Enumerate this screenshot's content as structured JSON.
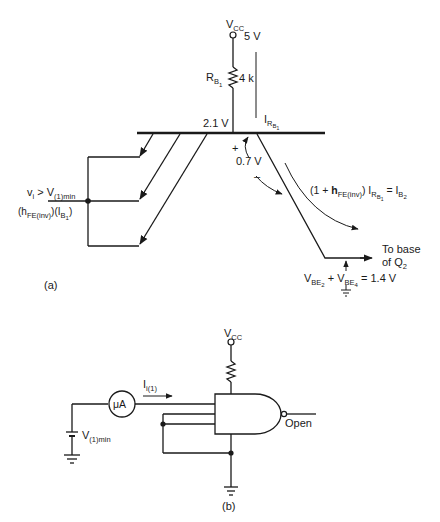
{
  "figure_a": {
    "caption": "(a)",
    "vcc_label": "V",
    "vcc_sub": "CC",
    "vcc_value": "5 V",
    "resistor_label": "R",
    "resistor_sub": "B",
    "resistor_subsub": "1",
    "resistor_value": "4 k",
    "base_voltage": "2.1 V",
    "current_label": "I",
    "current_sub": "R",
    "current_subsub": "B",
    "current_subsubsub": "1",
    "vbc_plus": "+",
    "vbc_value": "0.7 V",
    "vbc_minus": "–",
    "input_label_main": "v",
    "input_label_i": "i",
    "input_label_gt": " > V",
    "input_label_sub": "(1)min",
    "emitter_current_h": "(h",
    "emitter_current_hsub": "FE(inv)",
    "emitter_current_rest": ")(I",
    "emitter_current_isub": "B",
    "emitter_current_isubsub": "1",
    "emitter_current_close": ")",
    "collector_eq_1": "(1 + ",
    "collector_eq_h": "h",
    "collector_eq_hsub": "FE(inv)",
    "collector_eq_2": ") I",
    "collector_eq_rsub": "R",
    "collector_eq_bsub": "B",
    "collector_eq_1sub": "1",
    "collector_eq_3": " = I",
    "collector_eq_b2": "B",
    "collector_eq_b2sub": "2",
    "to_base_1": "To base",
    "to_base_2": "of Q",
    "to_base_2sub": "2",
    "vbe_eq_1": "V",
    "vbe_eq_1sub": "BE",
    "vbe_eq_1subsub": "2",
    "vbe_eq_plus": " + V",
    "vbe_eq_2sub": "BE",
    "vbe_eq_2subsub": "4",
    "vbe_eq_value": " = 1.4 V"
  },
  "figure_b": {
    "caption": "(b)",
    "vcc_label": "V",
    "vcc_sub": "CC",
    "meter_label": "μA",
    "current_label": "I",
    "current_sub": "i(1)",
    "source_label": "V",
    "source_sub": "(1)min",
    "output_label": "Open"
  }
}
